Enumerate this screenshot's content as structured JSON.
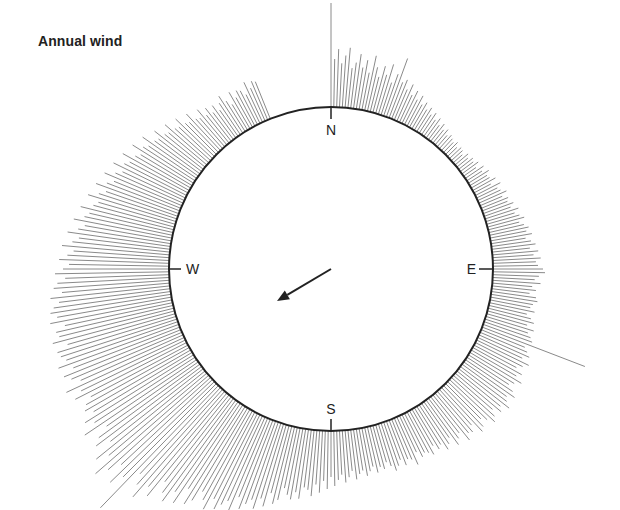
{
  "title": "Annual wind",
  "compass": {
    "north": "N",
    "east": "E",
    "south": "S",
    "west": "W"
  },
  "colors": {
    "bars": "#8a8a8a",
    "circle": "#222222",
    "arrow": "#222222",
    "text": "#222222"
  },
  "chart_data": {
    "type": "radial-bar",
    "title": "Annual wind",
    "center": [
      331,
      269
    ],
    "radius": 162,
    "direction_labels": [
      "N",
      "E",
      "S",
      "W"
    ],
    "bar_step_deg": 1,
    "bar_lengths": [
      104,
      48,
      58,
      44,
      52,
      60,
      40,
      46,
      55,
      42,
      50,
      38,
      56,
      45,
      36,
      48,
      40,
      52,
      34,
      44,
      62,
      38,
      42,
      33,
      40,
      30,
      36,
      28,
      34,
      26,
      30,
      24,
      28,
      22,
      26,
      20,
      24,
      18,
      22,
      17,
      20,
      15,
      18,
      16,
      14,
      17,
      13,
      16,
      15,
      12,
      17,
      14,
      18,
      16,
      20,
      15,
      22,
      18,
      24,
      20,
      21,
      26,
      19,
      28,
      23,
      25,
      30,
      24,
      29,
      27,
      32,
      28,
      35,
      30,
      34,
      38,
      32,
      36,
      40,
      37,
      42,
      35,
      40,
      44,
      38,
      46,
      41,
      48,
      43,
      45,
      50,
      52,
      46,
      42,
      48,
      40,
      44,
      38,
      45,
      47,
      43,
      41,
      46,
      39,
      44,
      48,
      42,
      50,
      45,
      49,
      52,
      110,
      47,
      51,
      55,
      49,
      58,
      53,
      48,
      56,
      52,
      60,
      54,
      50,
      57,
      62,
      55,
      58,
      64,
      56,
      60,
      52,
      58,
      62,
      55,
      50,
      57,
      60,
      48,
      54,
      52,
      58,
      46,
      50,
      55,
      44,
      49,
      53,
      45,
      48,
      42,
      50,
      46,
      44,
      47,
      40,
      52,
      45,
      43,
      48,
      41,
      46,
      50,
      44,
      39,
      45,
      42,
      47,
      40,
      44,
      48,
      42,
      45,
      50,
      41,
      47,
      52,
      44,
      49,
      55,
      46,
      58,
      50,
      62,
      54,
      66,
      60,
      58,
      70,
      64,
      72,
      68,
      62,
      75,
      80,
      70,
      85,
      78,
      90,
      82,
      88,
      95,
      84,
      100,
      92,
      98,
      105,
      96,
      110,
      102,
      95,
      108,
      115,
      100,
      120,
      110,
      125,
      118,
      108,
      130,
      122,
      140,
      128,
      118,
      170,
      132,
      145,
      125,
      138,
      150,
      128,
      140,
      118,
      132,
      125,
      112,
      135,
      120,
      128,
      115,
      122,
      118,
      110,
      125,
      116,
      130,
      112,
      120,
      126,
      114,
      128,
      118,
      122,
      124,
      112,
      126,
      118,
      120,
      110,
      124,
      116,
      122,
      118,
      112,
      120,
      108,
      116,
      112,
      104,
      114,
      106,
      100,
      110,
      102,
      96,
      108,
      98,
      92,
      104,
      94,
      88,
      100,
      90,
      86,
      96,
      84,
      80,
      92,
      82,
      76,
      88,
      78,
      72,
      84,
      74,
      68,
      80,
      70,
      66,
      76,
      64,
      60,
      72,
      62,
      58,
      68,
      56,
      54,
      62,
      52,
      50,
      58,
      48,
      46,
      54,
      44,
      42,
      50,
      40,
      38,
      46,
      36,
      42,
      34,
      40,
      32,
      38,
      44,
      36,
      30,
      42,
      34,
      40,
      38,
      32,
      44,
      36,
      42,
      40
    ],
    "max_bar": {
      "direction_deg": 235,
      "length": 170
    },
    "spikes": [
      {
        "direction_deg": 0,
        "length": 104
      },
      {
        "direction_deg": 111,
        "length": 110
      },
      {
        "direction_deg": 230,
        "length": 170
      }
    ],
    "mean_vector": {
      "from": [
        331,
        269
      ],
      "to": [
        277,
        301
      ],
      "direction": "toward WSW/SW"
    },
    "grid": false,
    "legend": null
  }
}
